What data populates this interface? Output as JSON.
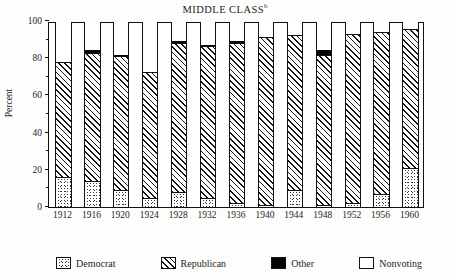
{
  "chart_data": {
    "type": "bar",
    "subtype": "stacked-bar-100",
    "title": "MIDDLE CLASS",
    "title_superscript": "b",
    "xlabel": "",
    "ylabel": "Percent",
    "ylim": [
      0,
      100
    ],
    "yticks": [
      0,
      20,
      40,
      60,
      80,
      100
    ],
    "ytick_labels": [
      "0",
      "20",
      "40",
      "60",
      "80",
      "100"
    ],
    "yminor_ticks": [
      10,
      30,
      50,
      70,
      90
    ],
    "grid": false,
    "legend_position": "bottom",
    "categories": [
      "1912",
      "1916",
      "1920",
      "1924",
      "1928",
      "1932",
      "1936",
      "1940",
      "1944",
      "1948",
      "1952",
      "1956",
      "1960"
    ],
    "series": [
      {
        "name": "Democrat",
        "pattern": "stipple",
        "values": [
          16,
          14,
          9,
          5,
          8,
          5,
          2,
          1,
          9,
          1,
          2,
          7,
          21
        ]
      },
      {
        "name": "Republican",
        "pattern": "diagonal-hatch",
        "values": [
          62,
          69,
          72,
          67.5,
          80,
          81.5,
          86,
          90.5,
          83.5,
          80.5,
          91,
          87,
          74.5
        ]
      },
      {
        "name": "Other",
        "pattern": "solid-black",
        "values": [
          0,
          1.5,
          0.5,
          0,
          1.5,
          0.5,
          1,
          0,
          0,
          3,
          0,
          0,
          0
        ]
      },
      {
        "name": "Nonvoting",
        "pattern": "white",
        "values": [
          22,
          15.5,
          18.5,
          27.5,
          10.5,
          13,
          11,
          8.5,
          7.5,
          15.5,
          7,
          6,
          4.5
        ]
      }
    ],
    "segment_tops": {
      "democrat_top": [
        16,
        14,
        9,
        5,
        8,
        5,
        2,
        1,
        9,
        1,
        2,
        7,
        21
      ],
      "republican_top": [
        78,
        83,
        81,
        72.5,
        88,
        86.5,
        88,
        91.5,
        92.5,
        81.5,
        93,
        94,
        95.5
      ],
      "other_top": [
        78,
        84.5,
        81.5,
        72.5,
        89.5,
        87,
        89,
        91.5,
        92.5,
        84.5,
        93,
        94,
        95.5
      ]
    }
  },
  "legend": {
    "items": [
      {
        "label": "Democrat",
        "swatch": "stipple-swatch"
      },
      {
        "label": "Republican",
        "swatch": "hatch-swatch"
      },
      {
        "label": "Other",
        "swatch": "black-swatch"
      },
      {
        "label": "Nonvoting",
        "swatch": "white-swatch"
      }
    ]
  },
  "colors": {
    "ink": "#111111",
    "other_fill": "#050505",
    "nonvoting_fill": "#ffffff",
    "background": "#fdfdfc"
  }
}
